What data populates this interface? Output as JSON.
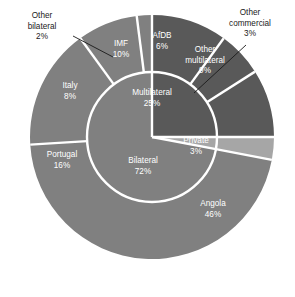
{
  "chart_data": {
    "type": "pie",
    "title": "",
    "subtitle": "",
    "xlabel": "",
    "ylabel": "",
    "legend_position": "none",
    "grid": false,
    "variant": "nested-donut",
    "units": "percent",
    "geometry": {
      "center_x": 152,
      "center_y": 137,
      "outer_radius": 122,
      "inner_radius": 65,
      "start_angle_deg": 0,
      "direction": "clockwise",
      "separator_color": "#ffffff",
      "separator_width": 2.4
    },
    "colors": {
      "dark_gray": "#595959",
      "medium_gray": "#808080",
      "light_gray": "#a6a6a6",
      "label_light": "#ffffff",
      "label_dark": "#1a1a1a",
      "background": "#ffffff"
    },
    "rings": [
      {
        "name": "inner",
        "radius_from": 0,
        "radius_to": 65,
        "categories": [
          "Multilateral",
          "Private",
          "Bilateral"
        ],
        "values": [
          25,
          3,
          72
        ],
        "colors": [
          "#595959",
          "#a6a6a6",
          "#808080"
        ],
        "slices": [
          {
            "label": "Multilateral",
            "value": 25,
            "value_text": "25%",
            "color": "#595959",
            "label_color": "#ffffff",
            "label_x": 152,
            "label_y": 95,
            "label_lines": [
              "Multilateral",
              "25%"
            ]
          },
          {
            "label": "Private",
            "value": 3,
            "value_text": "3%",
            "color": "#a6a6a6",
            "label_color": "#ffffff",
            "label_x": 196,
            "label_y": 143,
            "label_lines": [
              "Private",
              "3%"
            ]
          },
          {
            "label": "Bilateral",
            "value": 72,
            "value_text": "72%",
            "color": "#808080",
            "label_color": "#ffffff",
            "label_x": 143,
            "label_y": 163,
            "label_lines": [
              "Bilateral",
              "72%"
            ]
          }
        ]
      },
      {
        "name": "outer",
        "radius_from": 65,
        "radius_to": 122,
        "categories": [
          "IMF",
          "AfDB",
          "Other multilateral",
          "Other commercial",
          "Angola",
          "Portugal",
          "Italy",
          "Other bilateral"
        ],
        "values": [
          10,
          6,
          9,
          3,
          46,
          16,
          8,
          2
        ],
        "colors": [
          "#595959",
          "#595959",
          "#595959",
          "#a6a6a6",
          "#808080",
          "#808080",
          "#808080",
          "#808080"
        ],
        "slices": [
          {
            "label": "IMF",
            "value": 10,
            "value_text": "10%",
            "color": "#595959",
            "label_color": "#ffffff",
            "label_x": 121,
            "label_y": 46,
            "label_lines": [
              "IMF",
              "10%"
            ],
            "parent": "Multilateral"
          },
          {
            "label": "AfDB",
            "value": 6,
            "value_text": "6%",
            "color": "#595959",
            "label_color": "#ffffff",
            "label_x": 162,
            "label_y": 38,
            "label_lines": [
              "AfDB",
              "6%"
            ],
            "parent": "Multilateral"
          },
          {
            "label": "Other multilateral",
            "value": 9,
            "value_text": "9%",
            "color": "#595959",
            "label_color": "#ffffff",
            "label_x": 205,
            "label_y": 52,
            "label_lines": [
              "Other",
              "multilateral",
              "9%"
            ],
            "parent": "Multilateral"
          },
          {
            "label": "Other commercial",
            "value": 3,
            "value_text": "3%",
            "color": "#a6a6a6",
            "label_color": "#1a1a1a",
            "callout": true,
            "label_x": 250,
            "label_y": 15,
            "label_lines": [
              "Other",
              "commercial",
              "3%"
            ],
            "parent": "Private"
          },
          {
            "label": "Angola",
            "value": 46,
            "value_text": "46%",
            "color": "#808080",
            "label_color": "#ffffff",
            "label_x": 213,
            "label_y": 206,
            "label_lines": [
              "Angola",
              "46%"
            ],
            "parent": "Bilateral"
          },
          {
            "label": "Portugal",
            "value": 16,
            "value_text": "16%",
            "color": "#808080",
            "label_color": "#ffffff",
            "label_x": 62,
            "label_y": 157,
            "label_lines": [
              "Portugal",
              "16%"
            ],
            "parent": "Bilateral"
          },
          {
            "label": "Italy",
            "value": 8,
            "value_text": "8%",
            "color": "#808080",
            "label_color": "#ffffff",
            "label_x": 70,
            "label_y": 88,
            "label_lines": [
              "Italy",
              "8%"
            ],
            "parent": "Bilateral"
          },
          {
            "label": "Other bilateral",
            "value": 2,
            "value_text": "2%",
            "color": "#808080",
            "label_color": "#1a1a1a",
            "callout": true,
            "label_x": 42,
            "label_y": 18,
            "label_lines": [
              "Other",
              "bilateral",
              "2%"
            ],
            "parent": "Bilateral"
          }
        ]
      }
    ],
    "callouts": [
      {
        "label": "Other bilateral",
        "value_text": "2%",
        "leader_from": [
          73,
          36
        ],
        "leader_to": [
          113,
          57
        ]
      },
      {
        "label": "Other commercial",
        "value_text": "3%",
        "leader_from": [
          246,
          45
        ],
        "leader_to": [
          194,
          93
        ]
      }
    ]
  }
}
